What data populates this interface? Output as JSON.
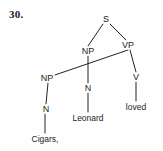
{
  "figure": {
    "item_number": "30.",
    "background_color": "#fefefe",
    "line_color": "#222222",
    "text_color": "#1b1b1b",
    "width": 163,
    "height": 151
  },
  "tree": {
    "nodes": [
      {
        "id": "s",
        "label": "S",
        "x": 106,
        "y": 19,
        "kind": "category"
      },
      {
        "id": "np_top",
        "label": "NP",
        "x": 88,
        "y": 51,
        "kind": "category"
      },
      {
        "id": "vp",
        "label": "VP",
        "x": 128,
        "y": 45,
        "kind": "category"
      },
      {
        "id": "np_left",
        "label": "NP",
        "x": 47,
        "y": 78,
        "kind": "category"
      },
      {
        "id": "n_left",
        "label": "N",
        "x": 46,
        "y": 109,
        "kind": "category"
      },
      {
        "id": "n_mid",
        "label": "N",
        "x": 88,
        "y": 88,
        "kind": "category"
      },
      {
        "id": "v",
        "label": "V",
        "x": 136,
        "y": 77,
        "kind": "category"
      },
      {
        "id": "cigars",
        "label": "Cigars,",
        "x": 45,
        "y": 139,
        "kind": "terminal"
      },
      {
        "id": "leonard",
        "label": "Leonard",
        "x": 88,
        "y": 118,
        "kind": "terminal"
      },
      {
        "id": "loved",
        "label": "loved",
        "x": 136,
        "y": 107,
        "kind": "terminal"
      }
    ],
    "edges": [
      {
        "from": "s",
        "to": "np_top",
        "x1": 103,
        "y1": 24,
        "x2": 88,
        "y2": 46
      },
      {
        "from": "s",
        "to": "vp",
        "x1": 110,
        "y1": 24,
        "x2": 126,
        "y2": 40
      },
      {
        "from": "vp",
        "to": "np_left",
        "x1": 128,
        "y1": 50,
        "x2": 52,
        "y2": 76
      },
      {
        "from": "np_top",
        "to": "n_mid",
        "x1": 88,
        "y1": 56,
        "x2": 88,
        "y2": 83
      },
      {
        "from": "np_left",
        "to": "n_left",
        "x1": 48,
        "y1": 83,
        "x2": 46,
        "y2": 104
      },
      {
        "from": "vp",
        "to": "v",
        "x1": 130,
        "y1": 50,
        "x2": 136,
        "y2": 72
      },
      {
        "from": "n_left",
        "to": "cigars",
        "x1": 45,
        "y1": 114,
        "x2": 45,
        "y2": 133
      },
      {
        "from": "n_mid",
        "to": "leonard",
        "x1": 88,
        "y1": 93,
        "x2": 88,
        "y2": 112
      },
      {
        "from": "v",
        "to": "loved",
        "x1": 136,
        "y1": 82,
        "x2": 136,
        "y2": 101
      }
    ]
  }
}
